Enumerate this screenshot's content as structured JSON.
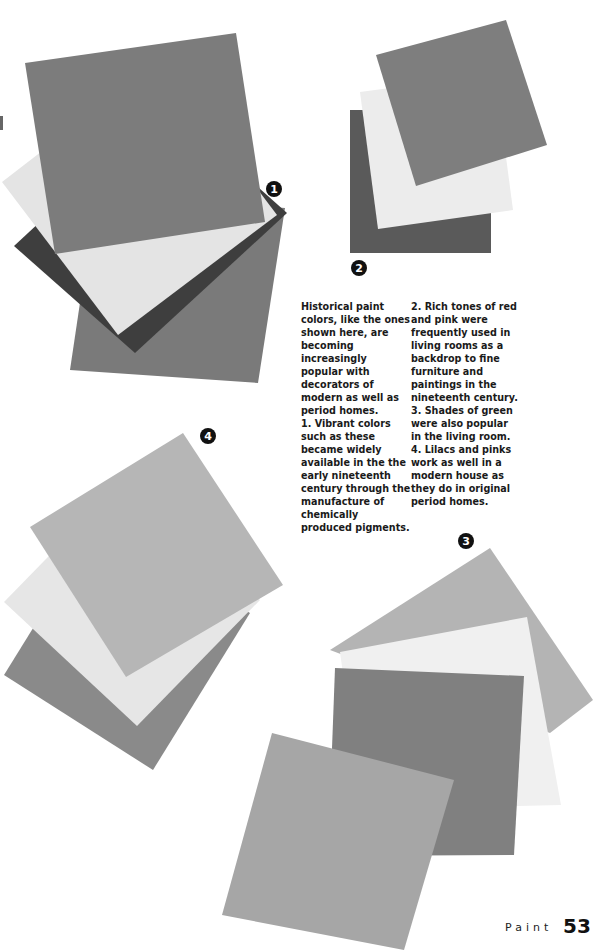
{
  "page": {
    "section": "Paint",
    "number": "53"
  },
  "badges": [
    "1",
    "2",
    "3",
    "4"
  ],
  "caption": {
    "intro": "Historical paint colors, like the ones shown here, are becoming increasingly popular with decorators of modern as well as period homes.",
    "items": [
      {
        "num": "1.",
        "text": "Vibrant colors such as these became widely available in the the early nineteenth century through the manufacture of chemically produced pigments."
      },
      {
        "num": "2.",
        "text": "Rich tones of red and pink were frequently used in living rooms as a backdrop to fine furniture and paintings in the nineteenth century."
      },
      {
        "num": "3.",
        "text": "Shades of green were also popular in the living room."
      },
      {
        "num": "4.",
        "text": "Lilacs and pinks work as well in a modern house as they do in original period homes."
      }
    ]
  },
  "swatch_groups": [
    {
      "id": 1,
      "colors": [
        "#7c7c7c",
        "#3e3e3e",
        "#e4e4e4",
        "#7a7a7a"
      ]
    },
    {
      "id": 2,
      "colors": [
        "#5a5a5a",
        "#ececec",
        "#7e7e7e"
      ]
    },
    {
      "id": 3,
      "colors": [
        "#b4b4b4",
        "#f0f0f0",
        "#808080",
        "#a6a6a6"
      ]
    },
    {
      "id": 4,
      "colors": [
        "#8a8a8a",
        "#e6e6e6",
        "#b6b6b6"
      ]
    }
  ]
}
